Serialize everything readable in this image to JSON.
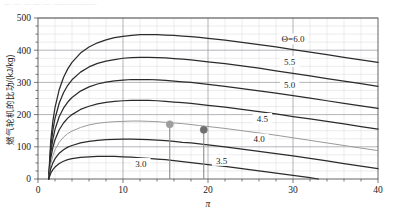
{
  "top_cut_text": "— — —  —  — ——————",
  "chart_data": {
    "type": "line",
    "title": "",
    "xlabel": "π",
    "ylabel": "燃气轮机的比功/(kJ/kg)",
    "xlim": [
      0,
      40
    ],
    "ylim": [
      0,
      500
    ],
    "xticks": [
      0,
      10,
      20,
      30,
      40
    ],
    "xtick_labels": [
      "0",
      "10",
      "20",
      "30",
      "40"
    ],
    "yticks": [
      0,
      100,
      200,
      300,
      400,
      500
    ],
    "ytick_labels": [
      "0",
      "100",
      "200",
      "300",
      "400",
      "500"
    ],
    "x_minor_step": 2,
    "y_minor_step": 25,
    "grid": true,
    "legend": "inline-curve-labels",
    "legend_position": "right-of-curves",
    "series_label_prefix": "Θ=",
    "series": [
      {
        "name": "6.0",
        "label": "Θ=6.0",
        "color": "#2b2b2b",
        "label_x": 30.0,
        "label_y": 435,
        "points": [
          [
            1.25,
            0
          ],
          [
            1.5,
            120
          ],
          [
            1.75,
            180
          ],
          [
            2.0,
            222
          ],
          [
            2.5,
            278
          ],
          [
            3.0,
            315
          ],
          [
            3.5,
            342
          ],
          [
            4.0,
            362
          ],
          [
            5.0,
            391
          ],
          [
            6.0,
            410
          ],
          [
            7.0,
            423
          ],
          [
            8.0,
            432
          ],
          [
            9.0,
            439
          ],
          [
            10.0,
            443
          ],
          [
            11.0,
            446
          ],
          [
            12.0,
            448
          ],
          [
            13.0,
            448
          ],
          [
            14.0,
            448
          ],
          [
            15.0,
            447
          ],
          [
            16.0,
            446
          ],
          [
            17.0,
            444
          ],
          [
            18.0,
            442
          ],
          [
            19.0,
            440
          ],
          [
            20.0,
            437
          ],
          [
            22.0,
            431
          ],
          [
            24.0,
            424
          ],
          [
            26.0,
            417
          ],
          [
            28.0,
            410
          ],
          [
            30.0,
            402
          ],
          [
            32.0,
            394
          ],
          [
            34.0,
            386
          ],
          [
            36.0,
            378
          ],
          [
            38.0,
            370
          ],
          [
            40.0,
            362
          ]
        ]
      },
      {
        "name": "5.5",
        "label": "5.5",
        "color": "#2b2b2b",
        "label_x": 29.6,
        "label_y": 365,
        "points": [
          [
            1.25,
            0
          ],
          [
            1.5,
            100
          ],
          [
            1.75,
            152
          ],
          [
            2.0,
            188
          ],
          [
            2.5,
            236
          ],
          [
            3.0,
            268
          ],
          [
            3.5,
            291
          ],
          [
            4.0,
            308
          ],
          [
            5.0,
            332
          ],
          [
            6.0,
            348
          ],
          [
            7.0,
            359
          ],
          [
            8.0,
            366
          ],
          [
            9.0,
            371
          ],
          [
            10.0,
            375
          ],
          [
            11.0,
            377
          ],
          [
            12.0,
            378
          ],
          [
            13.0,
            378
          ],
          [
            14.0,
            377
          ],
          [
            15.0,
            376
          ],
          [
            16.0,
            374
          ],
          [
            17.0,
            372
          ],
          [
            18.0,
            370
          ],
          [
            19.0,
            367
          ],
          [
            20.0,
            364
          ],
          [
            22.0,
            358
          ],
          [
            24.0,
            351
          ],
          [
            26.0,
            344
          ],
          [
            28.0,
            336
          ],
          [
            30.0,
            328
          ],
          [
            32.0,
            320
          ],
          [
            34.0,
            312
          ],
          [
            36.0,
            304
          ],
          [
            38.0,
            296
          ],
          [
            40.0,
            288
          ]
        ]
      },
      {
        "name": "5.0",
        "label": "5.0",
        "color": "#2b2b2b",
        "label_x": 29.6,
        "label_y": 292,
        "points": [
          [
            1.25,
            0
          ],
          [
            1.5,
            82
          ],
          [
            1.75,
            124
          ],
          [
            2.0,
            154
          ],
          [
            2.5,
            194
          ],
          [
            3.0,
            220
          ],
          [
            3.5,
            239
          ],
          [
            4.0,
            253
          ],
          [
            5.0,
            273
          ],
          [
            6.0,
            286
          ],
          [
            7.0,
            295
          ],
          [
            8.0,
            301
          ],
          [
            9.0,
            305
          ],
          [
            10.0,
            307
          ],
          [
            11.0,
            309
          ],
          [
            12.0,
            309
          ],
          [
            13.0,
            309
          ],
          [
            14.0,
            308
          ],
          [
            15.0,
            306
          ],
          [
            16.0,
            304
          ],
          [
            17.0,
            302
          ],
          [
            18.0,
            300
          ],
          [
            19.0,
            297
          ],
          [
            20.0,
            294
          ],
          [
            22.0,
            288
          ],
          [
            24.0,
            281
          ],
          [
            26.0,
            274
          ],
          [
            28.0,
            267
          ],
          [
            30.0,
            259
          ],
          [
            32.0,
            251
          ],
          [
            34.0,
            243
          ],
          [
            36.0,
            235
          ],
          [
            38.0,
            227
          ],
          [
            40.0,
            219
          ]
        ]
      },
      {
        "name": "4.5",
        "label": "4.5",
        "color": "#2b2b2b",
        "label_x": 26.4,
        "label_y": 188,
        "points": [
          [
            1.25,
            0
          ],
          [
            1.5,
            64
          ],
          [
            1.75,
            98
          ],
          [
            2.0,
            122
          ],
          [
            2.5,
            153
          ],
          [
            3.0,
            174
          ],
          [
            3.5,
            189
          ],
          [
            4.0,
            200
          ],
          [
            5.0,
            216
          ],
          [
            6.0,
            226
          ],
          [
            7.0,
            233
          ],
          [
            8.0,
            238
          ],
          [
            9.0,
            241
          ],
          [
            10.0,
            243
          ],
          [
            11.0,
            244
          ],
          [
            12.0,
            244
          ],
          [
            13.0,
            244
          ],
          [
            14.0,
            243
          ],
          [
            15.0,
            241
          ],
          [
            16.0,
            239
          ],
          [
            17.0,
            237
          ],
          [
            18.0,
            235
          ],
          [
            19.0,
            232
          ],
          [
            20.0,
            229
          ],
          [
            22.0,
            223
          ],
          [
            24.0,
            216
          ],
          [
            26.0,
            209
          ],
          [
            28.0,
            202
          ],
          [
            30.0,
            194
          ],
          [
            32.0,
            187
          ],
          [
            34.0,
            179
          ],
          [
            36.0,
            171
          ],
          [
            38.0,
            163
          ],
          [
            40.0,
            155
          ]
        ]
      },
      {
        "name": "4.0",
        "label": "4.0",
        "color": "#9a9a9a",
        "label_x": 26.0,
        "label_y": 124,
        "highlighted": true,
        "points": [
          [
            1.25,
            0
          ],
          [
            1.5,
            47
          ],
          [
            1.75,
            72
          ],
          [
            2.0,
            91
          ],
          [
            2.5,
            114
          ],
          [
            3.0,
            130
          ],
          [
            3.5,
            141
          ],
          [
            4.0,
            149
          ],
          [
            5.0,
            160
          ],
          [
            6.0,
            168
          ],
          [
            7.0,
            173
          ],
          [
            8.0,
            176
          ],
          [
            9.0,
            178
          ],
          [
            10.0,
            179
          ],
          [
            11.0,
            180
          ],
          [
            12.0,
            180
          ],
          [
            13.0,
            179
          ],
          [
            14.0,
            178
          ],
          [
            15.0,
            176
          ],
          [
            16.0,
            174
          ],
          [
            17.0,
            172
          ],
          [
            18.0,
            169
          ],
          [
            19.0,
            166
          ],
          [
            20.0,
            163
          ],
          [
            22.0,
            157
          ],
          [
            24.0,
            150
          ],
          [
            26.0,
            143
          ],
          [
            28.0,
            136
          ],
          [
            30.0,
            128
          ],
          [
            32.0,
            120
          ],
          [
            34.0,
            112
          ],
          [
            36.0,
            104
          ],
          [
            38.0,
            96
          ],
          [
            40.0,
            88
          ]
        ]
      },
      {
        "name": "3.5",
        "label": "3.5",
        "color": "#2b2b2b",
        "label_x": 21.6,
        "label_y": 58,
        "points": [
          [
            1.25,
            0
          ],
          [
            1.5,
            32
          ],
          [
            1.75,
            50
          ],
          [
            2.0,
            63
          ],
          [
            2.5,
            80
          ],
          [
            3.0,
            91
          ],
          [
            3.5,
            99
          ],
          [
            4.0,
            104
          ],
          [
            5.0,
            112
          ],
          [
            6.0,
            117
          ],
          [
            7.0,
            120
          ],
          [
            8.0,
            122
          ],
          [
            9.0,
            123
          ],
          [
            10.0,
            124
          ],
          [
            11.0,
            124
          ],
          [
            12.0,
            123
          ],
          [
            13.0,
            122
          ],
          [
            14.0,
            121
          ],
          [
            15.0,
            119
          ],
          [
            16.0,
            117
          ],
          [
            17.0,
            114
          ],
          [
            18.0,
            112
          ],
          [
            19.0,
            109
          ],
          [
            20.0,
            106
          ],
          [
            22.0,
            100
          ],
          [
            24.0,
            93
          ],
          [
            26.0,
            86
          ],
          [
            28.0,
            79
          ],
          [
            30.0,
            72
          ],
          [
            32.0,
            64
          ],
          [
            34.0,
            56
          ],
          [
            36.0,
            48
          ],
          [
            38.0,
            40
          ],
          [
            40.0,
            32
          ]
        ]
      },
      {
        "name": "3.0",
        "label": "3.0",
        "color": "#2b2b2b",
        "label_x": 12.1,
        "label_y": 48,
        "points": [
          [
            1.25,
            0
          ],
          [
            1.5,
            18
          ],
          [
            1.75,
            29
          ],
          [
            2.0,
            37
          ],
          [
            2.5,
            48
          ],
          [
            3.0,
            55
          ],
          [
            3.5,
            60
          ],
          [
            4.0,
            63
          ],
          [
            5.0,
            67
          ],
          [
            6.0,
            69
          ],
          [
            7.0,
            70
          ],
          [
            8.0,
            70
          ],
          [
            9.0,
            70
          ],
          [
            10.0,
            69
          ],
          [
            11.0,
            68
          ],
          [
            12.0,
            66
          ],
          [
            13.0,
            64
          ],
          [
            14.0,
            62
          ],
          [
            15.0,
            60
          ],
          [
            16.0,
            57
          ],
          [
            17.0,
            54
          ],
          [
            18.0,
            51
          ],
          [
            19.0,
            48
          ],
          [
            20.0,
            45
          ],
          [
            22.0,
            39
          ],
          [
            24.0,
            32
          ],
          [
            26.0,
            25
          ],
          [
            28.0,
            18
          ],
          [
            30.0,
            11
          ],
          [
            32.0,
            4
          ],
          [
            33.0,
            0
          ]
        ]
      }
    ],
    "markers": [
      {
        "name": "marker-a",
        "x": 15.5,
        "y": 170,
        "color": "#9e9e9e",
        "dropline": true,
        "on_series": "4.0"
      },
      {
        "name": "marker-b",
        "x": 19.5,
        "y": 153,
        "color": "#6e6e6e",
        "dropline": true,
        "on_series": "4.0"
      }
    ]
  }
}
